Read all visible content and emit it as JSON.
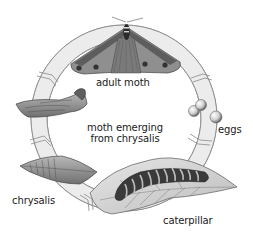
{
  "diagram": {
    "stages": [
      {
        "id": "adult-moth",
        "label": "adult moth",
        "icon": "moth-icon"
      },
      {
        "id": "eggs",
        "label": "eggs",
        "icon": "eggs-icon"
      },
      {
        "id": "caterpillar",
        "label": "caterpillar",
        "icon": "caterpillar-icon"
      },
      {
        "id": "chrysalis",
        "label": "chrysalis",
        "icon": "chrysalis-icon"
      },
      {
        "id": "moth-emerging",
        "label_line1": "moth emerging",
        "label_line2": "from chrysalis",
        "icon": "emerging-chrysalis-icon"
      }
    ],
    "colors": {
      "ring_fill": "#ececec",
      "ring_stroke": "#8a8a8a",
      "moth_wing": "#8f8f8f",
      "moth_wing_dark": "#555555",
      "egg": "#d8d8d8",
      "leaf": "#d4d4d4",
      "caterpillar": "#3a3a3a",
      "chrysalis": "#9a9a9a"
    }
  }
}
